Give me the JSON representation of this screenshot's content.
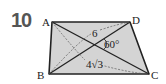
{
  "problem": {
    "number": "10"
  },
  "figure": {
    "type": "trapezoid",
    "vertices": {
      "A": {
        "label": "A",
        "x": 52,
        "y": 22
      },
      "D": {
        "label": "D",
        "x": 130,
        "y": 22
      },
      "B": {
        "label": "B",
        "x": 49,
        "y": 74
      },
      "C": {
        "label": "C",
        "x": 149,
        "y": 74
      }
    },
    "diagonals": [
      "AC",
      "BD"
    ],
    "measurements": {
      "bd_length": "6",
      "angle": "60°",
      "ac_length": "4√3"
    },
    "colors": {
      "fill": "#d4d4d4",
      "stroke": "#222222",
      "dashed": "#555555"
    }
  }
}
